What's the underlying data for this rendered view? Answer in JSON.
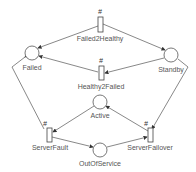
{
  "diagram": {
    "type": "petri-net",
    "places": [
      {
        "id": "failed",
        "label": "Failed",
        "x": 32,
        "y": 53
      },
      {
        "id": "standby",
        "label": "Standby",
        "x": 171,
        "y": 55
      },
      {
        "id": "active",
        "label": "Active",
        "x": 100,
        "y": 102
      },
      {
        "id": "outofservice",
        "label": "OutOfService",
        "x": 100,
        "y": 150
      }
    ],
    "transitions": [
      {
        "id": "failed2healthy",
        "label": "Failed2Healthy",
        "marker": "#",
        "x": 100,
        "y": 25
      },
      {
        "id": "healthy2failed",
        "label": "Healthy2Failed",
        "marker": "#",
        "x": 101,
        "y": 73
      },
      {
        "id": "serverfault",
        "label": "ServerFault",
        "marker": "#",
        "x": 49,
        "y": 135
      },
      {
        "id": "serverfailover",
        "label": "ServerFailover",
        "marker": "#",
        "x": 150,
        "y": 135
      }
    ],
    "arcs": [
      {
        "from": "failed2healthy",
        "to": "failed"
      },
      {
        "from": "failed2healthy",
        "to": "standby"
      },
      {
        "from": "healthy2failed",
        "to": "failed"
      },
      {
        "from": "standby",
        "to": "healthy2failed"
      },
      {
        "from": "failed",
        "to": "serverfault"
      },
      {
        "from": "active",
        "to": "serverfault"
      },
      {
        "from": "serverfault",
        "to": "outofservice"
      },
      {
        "from": "outofservice",
        "to": "serverfailover"
      },
      {
        "from": "standby",
        "to": "serverfailover"
      },
      {
        "from": "serverfailover",
        "to": "active"
      }
    ]
  }
}
